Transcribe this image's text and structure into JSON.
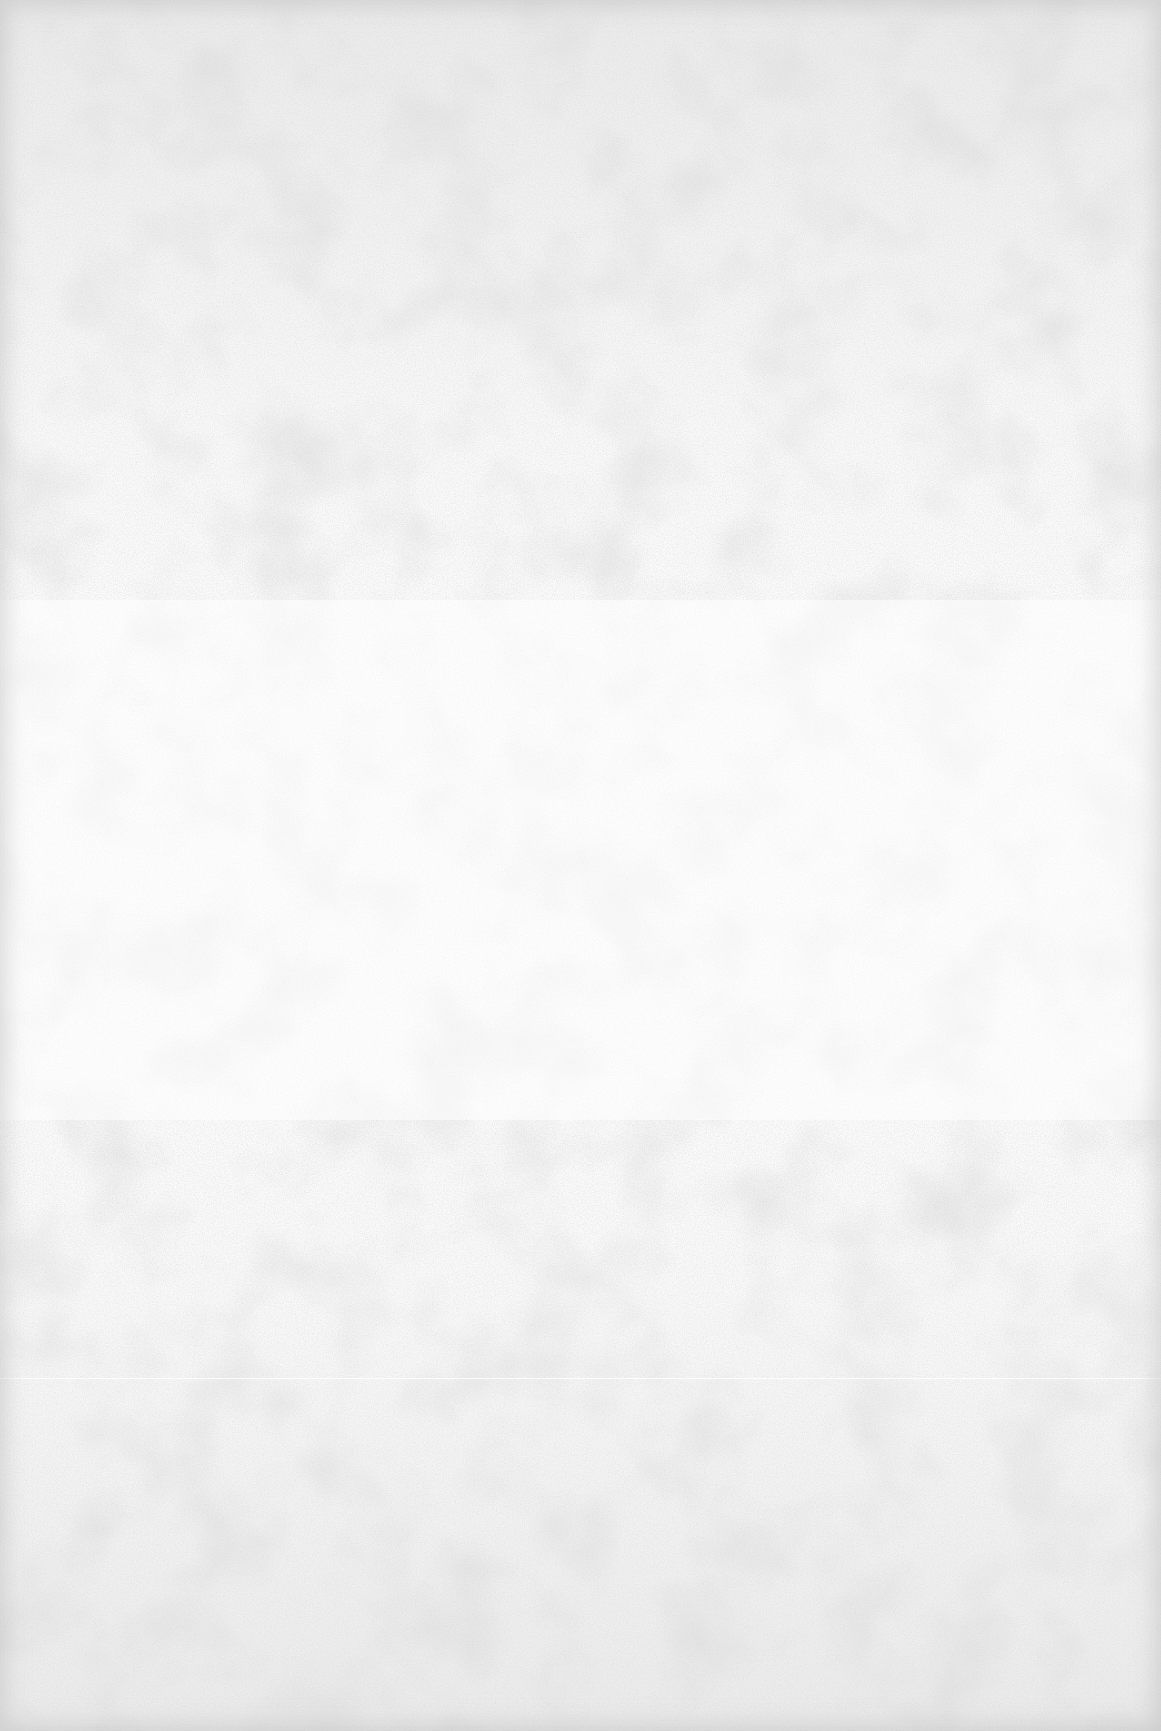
{
  "document": {
    "type": "scanned-page",
    "state": "blank",
    "text": "",
    "colors": {
      "paper": "#fbfbfb",
      "grain": "#c8c8c8",
      "edge": "#bebebe"
    }
  }
}
